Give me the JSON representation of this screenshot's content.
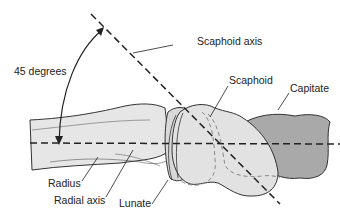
{
  "diagram": {
    "labels": {
      "angle": "45 degrees",
      "scaphoid_axis": "Scaphoid axis",
      "scaphoid": "Scaphoid",
      "capitate": "Capitate",
      "radius": "Radius",
      "radial_axis": "Radial axis",
      "lunate": "Lunate"
    },
    "colors": {
      "radius_fill": "#e6e6e6",
      "scaphoid_fill": "#e2e2e2",
      "capitate_fill": "#a9a9a9",
      "lunate_fill": "#d9d9d9",
      "outline": "#333333",
      "axis_line": "#222222",
      "hidden_line": "#888888"
    }
  }
}
